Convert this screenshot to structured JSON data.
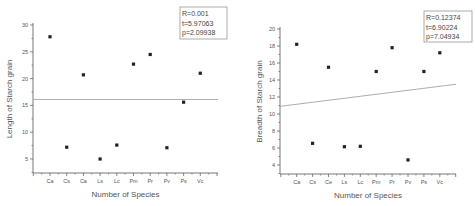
{
  "chart_data": [
    {
      "type": "scatter",
      "title": "",
      "xlabel": "Number of Species",
      "ylabel": "Length of Starch grain",
      "categories": [
        "Ca",
        "Cs",
        "Ca",
        "Ls",
        "Lc",
        "Pm",
        "Pr",
        "Pv",
        "Ps",
        "Vc"
      ],
      "values": [
        27.8,
        7.2,
        20.7,
        5.0,
        7.6,
        22.7,
        24.5,
        7.1,
        15.6,
        21.0
      ],
      "fit_line": {
        "start": 16.1,
        "end": 16.1
      },
      "ylim": [
        2.6,
        30
      ],
      "yticks": [
        5,
        10,
        15,
        20,
        25,
        30
      ],
      "stats": [
        "R=0.001",
        "t=5.97063",
        "p=2.09938"
      ],
      "grid": false
    },
    {
      "type": "scatter",
      "title": "",
      "xlabel": "Number of Species",
      "ylabel": "Breadth of Starch grain",
      "categories": [
        "Ca",
        "Cs",
        "Ce",
        "Ls",
        "Lc",
        "Pm",
        "Pr",
        "Pv",
        "Ps",
        "Vc"
      ],
      "values": [
        18.2,
        6.55,
        15.5,
        6.15,
        6.2,
        15.0,
        17.8,
        4.6,
        15.0,
        17.2
      ],
      "fit_line": {
        "start": 10.9,
        "end": 13.5
      },
      "ylim": [
        3,
        20
      ],
      "yticks": [
        4,
        6,
        8,
        10,
        12,
        14,
        16,
        18,
        20
      ],
      "stats": [
        "R=0.12374",
        "t=6.90224",
        "p=7.04934"
      ],
      "grid": false
    }
  ]
}
